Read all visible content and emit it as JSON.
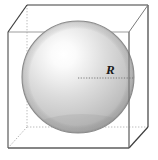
{
  "figure": {
    "background_color": "#ffffff",
    "labels": {
      "radius": "R"
    },
    "colors": {
      "cube_visible_edge": "#3d3d3d",
      "cube_hidden_edge": "#b4b4b4",
      "sphere_outline": "#8c8c8c",
      "sphere_light": "#ffffff",
      "sphere_mid": "#d2d2d2",
      "sphere_dark": "#9a9a9a",
      "sphere_shadow": "#8f8f8f",
      "radius_line": "#6e6e6e",
      "label_text": "#1a1a1a"
    },
    "geometry": {
      "cube_front_face": {
        "top_left": [
          8,
          32
        ],
        "top_right": [
          129,
          32
        ],
        "bottom_right": [
          129,
          148
        ],
        "bottom_left": [
          8,
          148
        ]
      },
      "cube_back_face": {
        "top_left": [
          27,
          5
        ],
        "top_right": [
          148,
          5
        ],
        "bottom_right": [
          148,
          127
        ],
        "bottom_left": [
          27,
          127
        ]
      },
      "sphere": {
        "center": [
          78,
          77
        ],
        "radius": 56,
        "highlight_center": [
          60,
          45
        ]
      },
      "radius_line": {
        "from": [
          78,
          78
        ],
        "to": [
          134,
          78
        ]
      },
      "radius_label_position": [
        106,
        74
      ]
    }
  }
}
